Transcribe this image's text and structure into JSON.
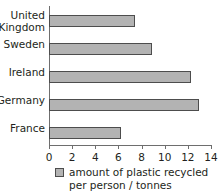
{
  "chart_data": {
    "type": "bar",
    "orientation": "horizontal",
    "title": "",
    "xlabel": "",
    "ylabel": "",
    "categories": [
      "United\nKingdom",
      "Sweden",
      "Ireland",
      "Germany",
      "France"
    ],
    "values": [
      7.4,
      8.9,
      12.3,
      13.0,
      6.2
    ],
    "xlim": [
      0,
      14
    ],
    "xticks": [
      "0",
      "2",
      "4",
      "6",
      "8",
      "10",
      "12",
      "14"
    ],
    "xtick_values": [
      0,
      2,
      4,
      6,
      8,
      10,
      12,
      14
    ],
    "grid": false,
    "legend": {
      "position": "bottom",
      "entries": [
        "amount of plastic recycled per person / tonnes"
      ]
    },
    "series": [
      {
        "name": "amount of plastic recycled per person / tonnes",
        "values": [
          7.4,
          8.9,
          12.3,
          13.0,
          6.2
        ]
      }
    ],
    "colors": {
      "bar_fill": "#b3b3b3",
      "bar_border": "#4d4d4d",
      "axis": "#6e6e6e",
      "text": "#231f20",
      "background": "#ffffff"
    }
  },
  "legend": {
    "label": "amount of plastic recycled per person / tonnes"
  }
}
